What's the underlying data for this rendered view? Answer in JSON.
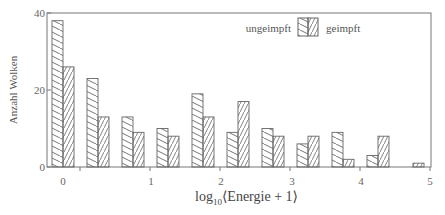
{
  "chart_data": {
    "type": "bar",
    "title": "",
    "xlabel": "log10(Energie + 1)",
    "xlabel_parts": {
      "pre": "log",
      "sub": "10",
      "post": "⟨Energie + 1⟩"
    },
    "ylabel": "Anzahl Wolken",
    "ylim": [
      0,
      40
    ],
    "xlim": [
      0,
      5
    ],
    "y_ticks": [
      0,
      20,
      40
    ],
    "x_ticks": [
      0,
      1,
      2,
      3,
      4,
      5
    ],
    "bin_width": 0.5,
    "categories": [
      "0-0.5",
      "0.5-1",
      "1-1.5",
      "1.5-2",
      "2-2.5",
      "2.5-3",
      "3-3.5",
      "3.5-4",
      "4-4.5",
      "4.5-5",
      "5-5.5"
    ],
    "series": [
      {
        "name": "ungeimpft",
        "hatch": "backslash",
        "values": [
          38,
          23,
          13,
          10,
          19,
          9,
          10,
          6,
          9,
          3,
          0
        ]
      },
      {
        "name": "geimpft",
        "hatch": "slash",
        "values": [
          26,
          13,
          9,
          8,
          13,
          17,
          8,
          8,
          2,
          8,
          1
        ]
      }
    ],
    "legend_position": "upper right",
    "grid": false
  },
  "legend": {
    "left_label": "ungeimpft",
    "right_label": "geimpft"
  },
  "colors": {
    "stroke": "#666666",
    "background": "#ffffff"
  }
}
